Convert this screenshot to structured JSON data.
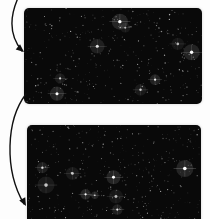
{
  "canvas": {
    "width": 210,
    "height": 219,
    "background_color": "#fdfdfd"
  },
  "panels": [
    {
      "id": "panel-top",
      "name": "starfield-panel-top",
      "label": "",
      "x": 24,
      "y": 8,
      "width": 178,
      "height": 96,
      "background_color": "#090909",
      "corner_radius": 5,
      "star_count": 420,
      "bright_star_count": 9,
      "star_color": "#ffffff",
      "seed": 1337
    },
    {
      "id": "panel-bottom",
      "name": "starfield-panel-bottom",
      "label": "",
      "x": 27,
      "y": 125,
      "width": 174,
      "height": 100,
      "background_color": "#090909",
      "corner_radius": 5,
      "star_count": 430,
      "bright_star_count": 9,
      "star_color": "#ffffff",
      "seed": 8642
    }
  ],
  "annotations": [
    {
      "id": "arrow-top",
      "name": "annotation-arrow-to-top-panel",
      "label": "",
      "color": "#101010",
      "path": "M 18 -2 C 10 16, 8 34, 22 51",
      "head_x": 24,
      "head_y": 52,
      "head_angle": 40
    },
    {
      "id": "arrow-bottom",
      "name": "annotation-arrow-to-bottom-panel",
      "label": "",
      "color": "#101010",
      "path": "M 26 94 C 6 120, 4 170, 24 204",
      "head_x": 26,
      "head_y": 206,
      "head_angle": 62
    }
  ],
  "chart_data": {
    "type": "scatter",
    "title": "",
    "xlabel": "",
    "ylabel": "",
    "panels": 2,
    "points_per_panel": [
      420,
      430
    ],
    "bright_points_per_panel": [
      9,
      9
    ],
    "xlim": [
      0,
      1
    ],
    "ylim": [
      0,
      1
    ],
    "grid": false,
    "legend": "none"
  }
}
